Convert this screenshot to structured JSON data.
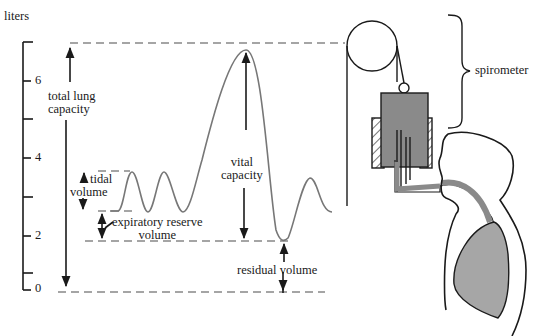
{
  "axis": {
    "unit_label": "liters",
    "ticks": [
      "0",
      "2",
      "4",
      "6"
    ]
  },
  "labels": {
    "total_lung_capacity": [
      "total lung",
      "capacity"
    ],
    "tidal_volume": [
      "tidal",
      "volume"
    ],
    "expiratory_reserve_volume": [
      "expiratory reserve",
      "volume"
    ],
    "vital_capacity": [
      "vital",
      "capacity"
    ],
    "residual_volume": "residual volume",
    "spirometer": "spirometer"
  },
  "colors": {
    "line": "#1a1a1a",
    "dashes": "#888888",
    "curve": "#777777",
    "fill_gray": "#8a8a8a",
    "lung_gray": "#a6a6a6"
  }
}
